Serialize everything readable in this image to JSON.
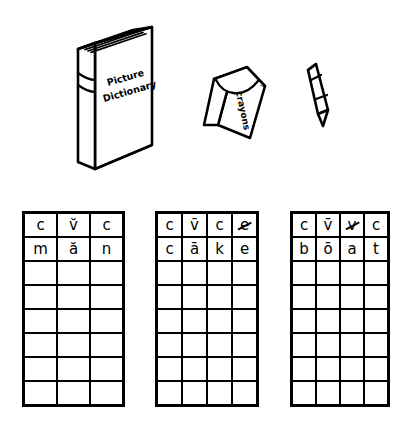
{
  "page": {
    "background_color": "#ffffff",
    "ink_color": "#000000"
  },
  "illustration": {
    "name": "classroom-supplies-line-art",
    "items": [
      {
        "name": "picture-dictionary-book",
        "cover_text_line1": "Picture",
        "cover_text_line2": "Dictionary"
      },
      {
        "name": "crayon-box",
        "label": "crayons"
      },
      {
        "name": "single-crayon",
        "label": ""
      }
    ]
  },
  "grids": [
    {
      "name": "grid-cvc-man",
      "columns": 3,
      "rows": 8,
      "pattern_row": [
        {
          "letter": "c",
          "struck": false
        },
        {
          "letter": "v̆",
          "struck": false
        },
        {
          "letter": "c",
          "struck": false
        }
      ],
      "word_row": [
        {
          "letter": "m",
          "struck": false
        },
        {
          "letter": "ă",
          "struck": false
        },
        {
          "letter": "n",
          "struck": false
        }
      ],
      "word": "man",
      "blank_rows": 6
    },
    {
      "name": "grid-cvce-cake",
      "columns": 4,
      "rows": 8,
      "pattern_row": [
        {
          "letter": "c",
          "struck": false
        },
        {
          "letter": "v̄",
          "struck": false
        },
        {
          "letter": "c",
          "struck": false
        },
        {
          "letter": "e",
          "struck": true
        }
      ],
      "word_row": [
        {
          "letter": "c",
          "struck": false
        },
        {
          "letter": "ā",
          "struck": false
        },
        {
          "letter": "k",
          "struck": false
        },
        {
          "letter": "e",
          "struck": false
        }
      ],
      "word": "cake",
      "blank_rows": 6
    },
    {
      "name": "grid-cvvc-boat",
      "columns": 4,
      "rows": 8,
      "pattern_row": [
        {
          "letter": "c",
          "struck": false
        },
        {
          "letter": "v̄",
          "struck": false
        },
        {
          "letter": "v",
          "struck": true
        },
        {
          "letter": "c",
          "struck": false
        }
      ],
      "word_row": [
        {
          "letter": "b",
          "struck": false
        },
        {
          "letter": "ō",
          "struck": false
        },
        {
          "letter": "a",
          "struck": false
        },
        {
          "letter": "t",
          "struck": false
        }
      ],
      "word": "boat",
      "blank_rows": 6
    }
  ]
}
